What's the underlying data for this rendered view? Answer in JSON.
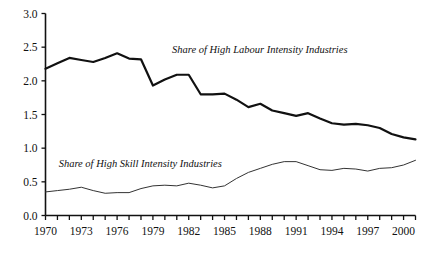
{
  "chart_data": {
    "type": "line",
    "title": "",
    "subtitle": "",
    "xlabel": "",
    "ylabel": "",
    "xlim": [
      1970,
      2001
    ],
    "ylim": [
      0.0,
      3.0
    ],
    "grid": false,
    "legend_position": "inline-annotation",
    "y_ticks": [
      "0.0",
      "0.5",
      "1.0",
      "1.5",
      "2.0",
      "2.5",
      "3.0"
    ],
    "y_tick_values": [
      0.0,
      0.5,
      1.0,
      1.5,
      2.0,
      2.5,
      3.0
    ],
    "x_ticks_labeled": [
      "1970",
      "1973",
      "1976",
      "1979",
      "1982",
      "1985",
      "1988",
      "1991",
      "1994",
      "1997",
      "2000"
    ],
    "x_tick_values_labeled": [
      1970,
      1973,
      1976,
      1979,
      1982,
      1985,
      1988,
      1991,
      1994,
      1997,
      2000
    ],
    "x": [
      1970,
      1971,
      1972,
      1973,
      1974,
      1975,
      1976,
      1977,
      1978,
      1979,
      1980,
      1981,
      1982,
      1983,
      1984,
      1985,
      1986,
      1987,
      1988,
      1989,
      1990,
      1991,
      1992,
      1993,
      1994,
      1995,
      1996,
      1997,
      1998,
      1999,
      2000,
      2001
    ],
    "series": [
      {
        "name": "Share of High Labour Intensity Industries",
        "annotation": "Share of High Labour Intensity Industries",
        "color": "#111111",
        "line_width": 2.2,
        "annotation_x": 1980.6,
        "annotation_y": 2.42,
        "values": [
          2.18,
          2.26,
          2.34,
          2.31,
          2.28,
          2.34,
          2.41,
          2.33,
          2.32,
          1.93,
          2.02,
          2.09,
          2.09,
          1.8,
          1.8,
          1.81,
          1.72,
          1.61,
          1.66,
          1.56,
          1.52,
          1.48,
          1.52,
          1.44,
          1.37,
          1.35,
          1.36,
          1.34,
          1.3,
          1.21,
          1.16,
          1.13
        ]
      },
      {
        "name": "Share of High Skill Intensity Industries",
        "annotation": "Share of High Skill Intensity Industries",
        "color": "#333333",
        "line_width": 1.0,
        "annotation_x": 1971.1,
        "annotation_y": 0.72,
        "values": [
          0.35,
          0.37,
          0.39,
          0.42,
          0.37,
          0.33,
          0.34,
          0.34,
          0.4,
          0.44,
          0.45,
          0.44,
          0.48,
          0.45,
          0.41,
          0.44,
          0.55,
          0.64,
          0.7,
          0.76,
          0.8,
          0.8,
          0.74,
          0.68,
          0.67,
          0.7,
          0.69,
          0.66,
          0.7,
          0.71,
          0.75,
          0.82
        ]
      }
    ]
  },
  "axes": {
    "y_axis_name": "value-axis",
    "x_axis_name": "year-axis"
  }
}
